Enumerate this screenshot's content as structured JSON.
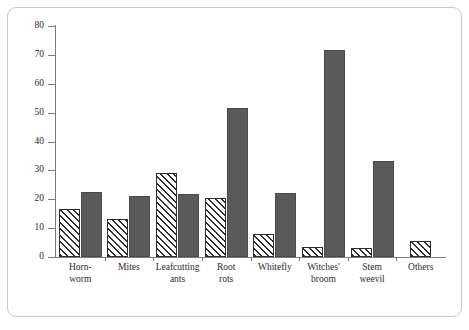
{
  "chart_data": {
    "type": "bar",
    "title": "",
    "subtitle": "",
    "xlabel": "",
    "ylabel": "Percentage",
    "ylim": [
      0,
      80
    ],
    "yticks": [
      0,
      10,
      20,
      30,
      40,
      50,
      60,
      70,
      80
    ],
    "ytick_labels": [
      "0",
      "10",
      "20",
      "30",
      "40",
      "50",
      "60",
      "70",
      "80"
    ],
    "grid": false,
    "legend": "none",
    "categories": [
      "Horn-\nworm",
      "Mites",
      "Leafcutting\nants",
      "Root\nrots",
      "Whitefly",
      "Witches'\nbroom",
      "Stem\nweevil",
      "Others"
    ],
    "series": [
      {
        "name": "hatched",
        "style": "diagonal-hatch",
        "color": "#2d2d2d",
        "values": [
          16.5,
          13.0,
          29.0,
          20.3,
          8.0,
          3.4,
          3.2,
          5.5
        ]
      },
      {
        "name": "solid",
        "style": "solid-fill",
        "color": "#5a5a5a",
        "values": [
          22.4,
          21.3,
          21.9,
          51.5,
          22.3,
          71.6,
          33.3,
          0
        ]
      }
    ],
    "annotations": []
  },
  "figure": {
    "frame_color": "#c9c9c9",
    "axis_color": "#7c7c7c",
    "background": "#ffffff"
  }
}
